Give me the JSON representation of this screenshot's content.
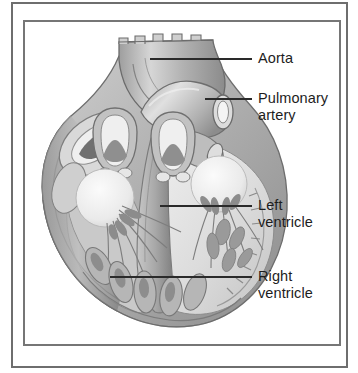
{
  "figure": {
    "kind": "anatomical-illustration",
    "style": "grayscale pencil-shaded line drawing",
    "frame": {
      "outer_border_color": "#6e6e6e",
      "inner_border_color": "#767676",
      "background": "#ffffff"
    }
  },
  "labels": [
    {
      "id": "aorta",
      "text": "Aorta",
      "x": 258,
      "y": 50,
      "leader": {
        "x1": 150,
        "y1": 59,
        "x2": 252,
        "y2": 59
      }
    },
    {
      "id": "pulmonary-artery",
      "text": "Pulmonary\nartery",
      "x": 258,
      "y": 90,
      "leader": {
        "x1": 205,
        "y1": 99,
        "x2": 252,
        "y2": 99
      }
    },
    {
      "id": "left-ventricle",
      "text": "Left\nventricle",
      "x": 258,
      "y": 197,
      "leader": {
        "x1": 160,
        "y1": 206,
        "x2": 252,
        "y2": 206
      }
    },
    {
      "id": "right-ventricle",
      "text": "Right\nventricle",
      "x": 258,
      "y": 268,
      "leader": {
        "x1": 110,
        "y1": 277,
        "x2": 252,
        "y2": 277
      }
    }
  ],
  "palette": {
    "ink": "#1d1d1d",
    "leader": "#2a2a2a",
    "tissue_light": "#e3e3e3",
    "tissue_mid": "#b4b4b4",
    "tissue_dark": "#8a8a8a",
    "tissue_deep": "#6a6a6a",
    "lumen": "#f2f2f2",
    "outline": "#5a5a5a"
  }
}
